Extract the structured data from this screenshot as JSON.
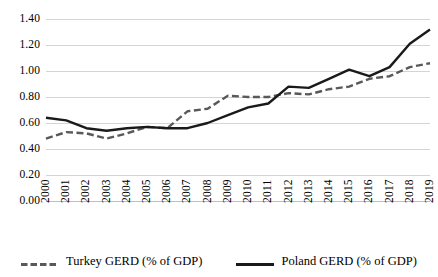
{
  "chart_data": {
    "type": "line",
    "title": "",
    "subtitle": "",
    "xlabel": "",
    "ylabel": "",
    "categories": [
      "2000",
      "2001",
      "2002",
      "2003",
      "2004",
      "2005",
      "2006",
      "2007",
      "2008",
      "2009",
      "2010",
      "2011",
      "2012",
      "2013",
      "2014",
      "2015",
      "2016",
      "2017",
      "2018",
      "2019"
    ],
    "series": [
      {
        "name": "Turkey GERD (% of GDP)",
        "style": "dashed",
        "color": "#595959",
        "values": [
          0.48,
          0.53,
          0.52,
          0.48,
          0.52,
          0.57,
          0.56,
          0.69,
          0.71,
          0.81,
          0.8,
          0.8,
          0.83,
          0.82,
          0.86,
          0.88,
          0.94,
          0.96,
          1.03,
          1.06
        ]
      },
      {
        "name": "Poland GERD (% of GDP)",
        "style": "solid",
        "color": "#1a1a1a",
        "values": [
          0.64,
          0.62,
          0.56,
          0.54,
          0.56,
          0.57,
          0.56,
          0.56,
          0.6,
          0.66,
          0.72,
          0.75,
          0.88,
          0.87,
          0.94,
          1.01,
          0.96,
          1.03,
          1.21,
          1.32
        ]
      }
    ],
    "ylim": [
      0.0,
      1.4
    ],
    "ytick_values": [
      1.4,
      1.2,
      1.0,
      0.8,
      0.6,
      0.4,
      0.2,
      0.0
    ],
    "ytick_labels": [
      "1.40",
      "1.20",
      "1.00",
      "0.80",
      "0.60",
      "0.40",
      "0.20",
      "0.00"
    ],
    "grid": "horizontal",
    "grid_color": "#d4d4d4",
    "legend_position": "bottom",
    "background": "#ffffff"
  },
  "legend": {
    "items": [
      {
        "label": "Turkey GERD (% of GDP)",
        "marker": "dashed-line-swatch"
      },
      {
        "label": "Poland GERD (% of GDP)",
        "marker": "solid-line-swatch"
      }
    ]
  }
}
